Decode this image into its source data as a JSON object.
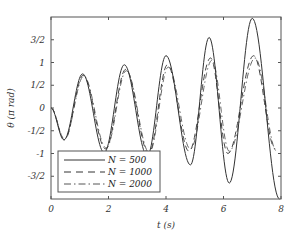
{
  "chart_data": {
    "type": "line",
    "title": "",
    "xlabel": "t (s)",
    "ylabel": "θ (π rad)",
    "xlim": [
      0,
      8
    ],
    "ylim": [
      -2,
      2
    ],
    "grid": false,
    "legend_position": "lower left",
    "xticks": [
      0,
      2,
      4,
      6,
      8
    ],
    "xtick_labels": [
      "0",
      "2",
      "4",
      "6",
      "8"
    ],
    "yticks": [
      -1.5,
      -1,
      -0.5,
      0,
      0.5,
      1,
      1.5
    ],
    "ytick_labels": [
      "-3/2",
      "-1",
      "-1/2",
      "0",
      "1/2",
      "1",
      "3/2"
    ],
    "series": [
      {
        "name": "N = 500",
        "style": "solid",
        "x": [
          0,
          0.45,
          1.1,
          1.85,
          2.55,
          3.35,
          4.0,
          4.85,
          5.5,
          6.2,
          7.0,
          7.95
        ],
        "y": [
          0,
          -0.7,
          0.75,
          -0.98,
          0.95,
          -1.05,
          1.15,
          -1.25,
          1.55,
          -1.65,
          1.97,
          -2.0
        ]
      },
      {
        "name": "N = 1000",
        "style": "dashed",
        "x": [
          0,
          0.47,
          1.12,
          1.9,
          2.6,
          3.4,
          4.05,
          4.8,
          5.55,
          6.15,
          7.05,
          7.8
        ],
        "y": [
          0,
          -0.7,
          0.72,
          -0.9,
          0.85,
          -1.0,
          0.95,
          -0.95,
          1.1,
          -1.0,
          1.15,
          -0.9
        ]
      },
      {
        "name": "N = 2000",
        "style": "dash-dot",
        "x": [
          0,
          0.47,
          1.14,
          1.92,
          2.62,
          3.42,
          4.08,
          4.85,
          5.6,
          6.2,
          7.1,
          7.85
        ],
        "y": [
          0,
          -0.68,
          0.7,
          -0.88,
          0.82,
          -0.98,
          0.9,
          -0.9,
          1.05,
          -0.95,
          1.1,
          -0.95
        ]
      }
    ]
  },
  "axes": {
    "xlabel": "t (s)",
    "ylabel": "θ (π rad)"
  },
  "legend": {
    "items": [
      {
        "label": "N = 500",
        "style": "solid"
      },
      {
        "label": "N = 1000",
        "style": "dashed"
      },
      {
        "label": "N = 2000",
        "style": "dash-dot"
      }
    ]
  }
}
